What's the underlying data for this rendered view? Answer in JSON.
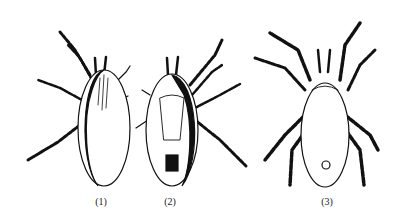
{
  "figure": {
    "panels": [
      {
        "label": "(1)",
        "subject": "mite-dorsal-view"
      },
      {
        "label": "(2)",
        "subject": "mite-ventral-view"
      },
      {
        "label": "(3)",
        "subject": "mite-ventral-view-detailed"
      }
    ]
  }
}
